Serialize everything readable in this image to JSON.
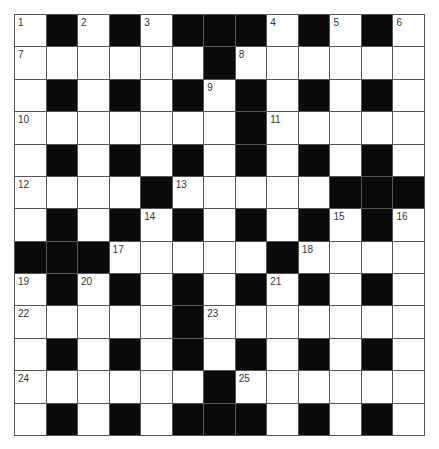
{
  "puzzle": {
    "type": "crossword",
    "rows": 13,
    "cols": 13,
    "colors": {
      "block": "#0a0a0a",
      "cell": "#ffffff",
      "grid_line": "#555555",
      "number": "#333333"
    },
    "layout": [
      "W.W.W...W.W.W",
      "WWWWWW.WWWWWW",
      "W.W.W.W.W.W.W",
      "WWWWWWW.WWWWW",
      "W.W.W.W.W.W.W",
      "WWWW.WWWWW...",
      "W.W.W.W.W.W.W",
      "...WWWWW.WWWW",
      "W.W.W.W.W.W.W",
      "WWWWW.WWWWWWW",
      "W.W.W.W.W.W.W",
      "WWWWWW.WWWWWW",
      "W.W.W...W.W.W"
    ],
    "numbers": [
      {
        "n": "1",
        "r": 0,
        "c": 0
      },
      {
        "n": "2",
        "r": 0,
        "c": 2
      },
      {
        "n": "3",
        "r": 0,
        "c": 4
      },
      {
        "n": "4",
        "r": 0,
        "c": 8
      },
      {
        "n": "5",
        "r": 0,
        "c": 10
      },
      {
        "n": "6",
        "r": 0,
        "c": 12
      },
      {
        "n": "7",
        "r": 1,
        "c": 0
      },
      {
        "n": "8",
        "r": 1,
        "c": 7
      },
      {
        "n": "9",
        "r": 2,
        "c": 6
      },
      {
        "n": "10",
        "r": 3,
        "c": 0
      },
      {
        "n": "11",
        "r": 3,
        "c": 8
      },
      {
        "n": "12",
        "r": 5,
        "c": 0
      },
      {
        "n": "13",
        "r": 5,
        "c": 5
      },
      {
        "n": "14",
        "r": 6,
        "c": 4
      },
      {
        "n": "15",
        "r": 6,
        "c": 10
      },
      {
        "n": "16",
        "r": 6,
        "c": 12
      },
      {
        "n": "17",
        "r": 7,
        "c": 3
      },
      {
        "n": "18",
        "r": 7,
        "c": 9
      },
      {
        "n": "19",
        "r": 8,
        "c": 0
      },
      {
        "n": "20",
        "r": 8,
        "c": 2
      },
      {
        "n": "21",
        "r": 8,
        "c": 8
      },
      {
        "n": "22",
        "r": 9,
        "c": 0
      },
      {
        "n": "23",
        "r": 9,
        "c": 6
      },
      {
        "n": "24",
        "r": 11,
        "c": 0
      },
      {
        "n": "25",
        "r": 11,
        "c": 7
      }
    ]
  }
}
